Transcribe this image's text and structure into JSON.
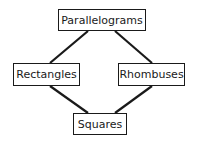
{
  "diagram": {
    "type": "hierarchy",
    "nodes": [
      {
        "id": "parallelograms",
        "label": "Parallelograms"
      },
      {
        "id": "rectangles",
        "label": "Rectangles"
      },
      {
        "id": "rhombuses",
        "label": "Rhombuses"
      },
      {
        "id": "squares",
        "label": "Squares"
      }
    ],
    "edges": [
      {
        "from": "parallelograms",
        "to": "rectangles"
      },
      {
        "from": "parallelograms",
        "to": "rhombuses"
      },
      {
        "from": "rectangles",
        "to": "squares"
      },
      {
        "from": "rhombuses",
        "to": "squares"
      }
    ]
  }
}
